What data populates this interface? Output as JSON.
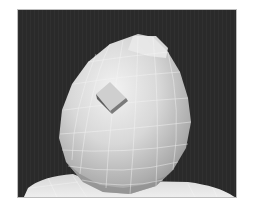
{
  "viewport": {
    "subject": "3D egg-shaped head mesh with wireframe overlay",
    "colors": {
      "background": "#2a2a2a",
      "mesh_light": "#e6e6e6",
      "mesh_mid": "#bdbdbd",
      "mesh_dark": "#8a8a8a",
      "wire": "#f4f4f4",
      "frame_border": "#bdbdbd"
    }
  }
}
